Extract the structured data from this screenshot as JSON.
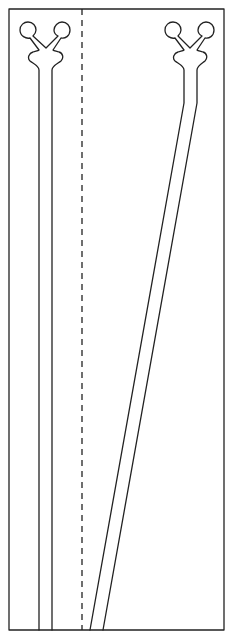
{
  "diagram": {
    "type": "technical line drawing",
    "colors": {
      "line": "#222222",
      "background": "#ffffff"
    },
    "frame": {
      "x": 9,
      "y": 9,
      "width": 215,
      "height": 621
    },
    "divider": {
      "style": "dashed",
      "x": 82
    },
    "channels": [
      {
        "id": "straight-channel",
        "head": "y-shaped bifurcation with two circular ports",
        "ports": [
          {
            "cx": 28,
            "cy": 30
          },
          {
            "cx": 62,
            "cy": 30
          }
        ],
        "walls_x": [
          39,
          52
        ],
        "path": "straight vertical"
      },
      {
        "id": "angled-channel",
        "head": "y-shaped bifurcation with two circular ports",
        "ports": [
          {
            "cx": 173,
            "cy": 30
          },
          {
            "cx": 206,
            "cy": 30
          }
        ],
        "walls_x_top": [
          184,
          197
        ],
        "bend_y": 103,
        "walls_x_bottom": [
          90,
          103
        ],
        "path": "vertical then angled toward lower-left"
      }
    ]
  }
}
